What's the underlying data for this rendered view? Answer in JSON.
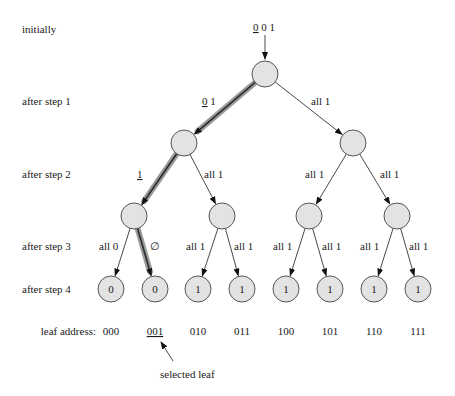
{
  "diagram": {
    "row_labels": [
      "initially",
      "after step 1",
      "after step 2",
      "after step 3",
      "after step 4"
    ],
    "initial_input": {
      "underlined": "0",
      "rest": " 0 1"
    },
    "nodes": {
      "root": {
        "label": ""
      },
      "level1": [
        {
          "label": ""
        },
        {
          "label": ""
        }
      ],
      "level2": [
        {
          "label": ""
        },
        {
          "label": ""
        },
        {
          "label": ""
        },
        {
          "label": ""
        }
      ],
      "leaves": [
        {
          "label": "0",
          "address": "000",
          "selected": false
        },
        {
          "label": "0",
          "address": "001",
          "selected": true
        },
        {
          "label": "1",
          "address": "010",
          "selected": false
        },
        {
          "label": "1",
          "address": "011",
          "selected": false
        },
        {
          "label": "1",
          "address": "100",
          "selected": false
        },
        {
          "label": "1",
          "address": "101",
          "selected": false
        },
        {
          "label": "1",
          "address": "110",
          "selected": false
        },
        {
          "label": "1",
          "address": "111",
          "selected": false
        }
      ]
    },
    "edge_labels": {
      "step1": [
        {
          "underlined": "0",
          "rest": " 1"
        },
        {
          "underlined": "",
          "rest": "all 1"
        }
      ],
      "step2": [
        {
          "underlined": "1",
          "rest": ""
        },
        {
          "underlined": "",
          "rest": "all 1"
        },
        {
          "underlined": "",
          "rest": "all 1"
        },
        {
          "underlined": "",
          "rest": "all 1"
        }
      ],
      "step3": [
        "all 0",
        "∅",
        "all 1",
        "all 1",
        "all 1",
        "all 1",
        "all 1",
        "all 1"
      ]
    },
    "highlighted_path": [
      "root",
      "level1-0",
      "level2-0",
      "leaf-1"
    ],
    "leaf_address_label": "leaf address:",
    "selected_leaf_label": "selected leaf"
  }
}
